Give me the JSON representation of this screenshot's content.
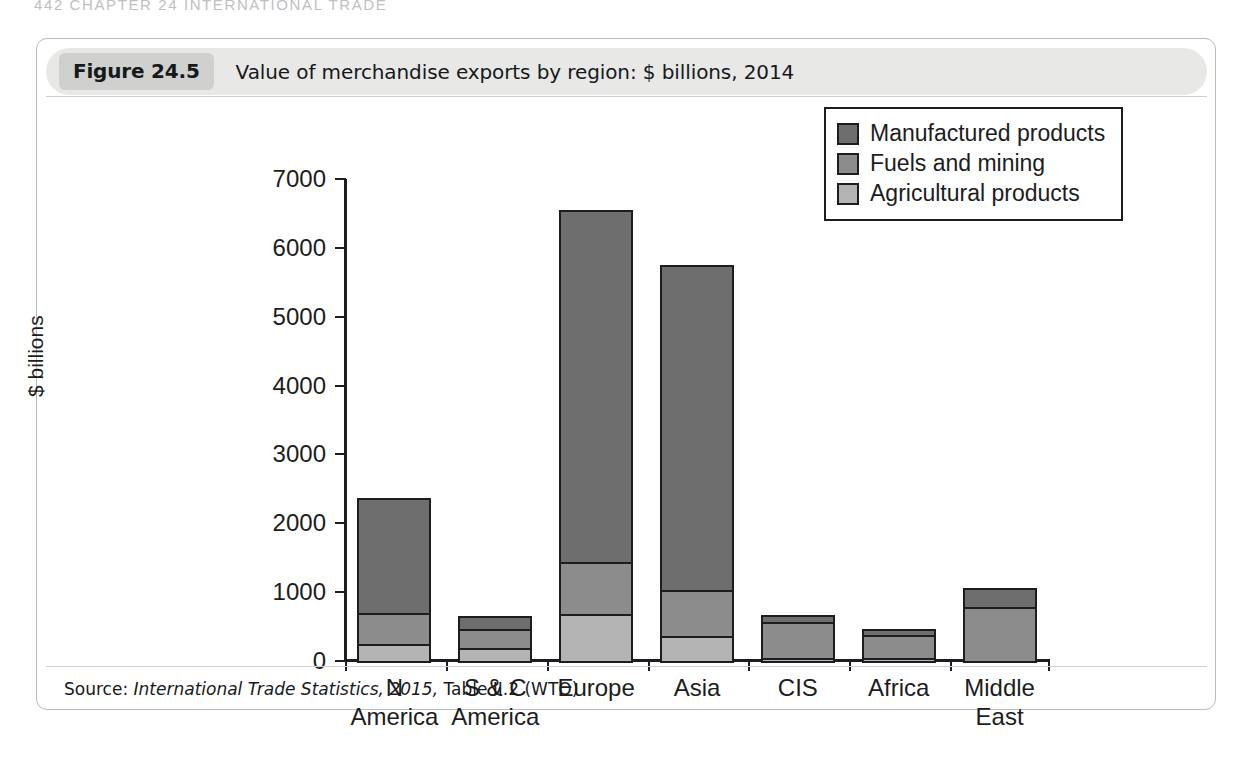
{
  "running_head": "442  CHAPTER 24  INTERNATIONAL TRADE",
  "figure": {
    "number_label": "Figure 24.5",
    "title": "Value of merchandise exports by region: $ billions, 2014",
    "source_prefix": "Source:",
    "source_italic": "International Trade Statistics, 2015,",
    "source_suffix": "Table II.2 (WTO)"
  },
  "colors": {
    "manufactured": "#6e6e6e",
    "fuels": "#8c8c8c",
    "agricultural": "#b4b4b4",
    "axis": "#1b1d20",
    "title_bar": "#e8e8e6",
    "number_chip": "#d0d0ce",
    "card_border": "#b9bcc0"
  },
  "chart_data": {
    "type": "bar",
    "stacked": true,
    "title": "Value of merchandise exports by region: $ billions, 2014",
    "xlabel": "",
    "ylabel": "$ billions",
    "ylim": [
      0,
      7000
    ],
    "yticks": [
      0,
      1000,
      2000,
      3000,
      4000,
      5000,
      6000,
      7000
    ],
    "ytick_labels": [
      "0",
      "1000",
      "2000",
      "3000",
      "4000",
      "5000",
      "6000",
      "7000"
    ],
    "grid": false,
    "legend_position": "upper right",
    "categories": [
      "N America",
      "S & C\nAmerica",
      "Europe",
      "Asia",
      "CIS",
      "Africa",
      "Middle\nEast"
    ],
    "series": [
      {
        "name": "Agricultural products",
        "color": "#b4b4b4",
        "values": [
          250,
          190,
          680,
          360,
          50,
          40,
          0
        ]
      },
      {
        "name": "Fuels and mining",
        "color": "#8c8c8c",
        "values": [
          440,
          270,
          760,
          670,
          510,
          340,
          790
        ]
      },
      {
        "name": "Manufactured products",
        "color": "#6e6e6e",
        "values": [
          1670,
          190,
          5110,
          4720,
          110,
          80,
          270
        ]
      }
    ],
    "totals": [
      2360,
      650,
      6550,
      5750,
      670,
      460,
      1060
    ],
    "legend_order": [
      "Manufactured products",
      "Fuels and mining",
      "Agricultural products"
    ]
  }
}
